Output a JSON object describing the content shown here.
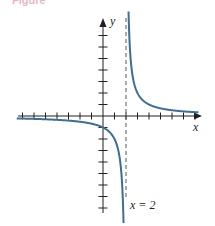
{
  "caption_fragment": "Figure",
  "chart_data": {
    "type": "line",
    "title": "",
    "function": "y = 2/(x - 2)",
    "xlabel": "x",
    "ylabel": "y",
    "xlim": [
      -7.5,
      8.5
    ],
    "ylim": [
      -9,
      8.5
    ],
    "x_ticks": [
      -7,
      -6,
      -5,
      -4,
      -3,
      -2,
      -1,
      1,
      2,
      3,
      4,
      5,
      6,
      7,
      8
    ],
    "y_ticks": [
      -8,
      -7,
      -6,
      -5,
      -4,
      -3,
      -2,
      -1,
      1,
      2,
      3,
      4,
      5,
      6,
      7
    ],
    "grid": false,
    "asymptote": {
      "type": "vertical",
      "x": 2,
      "label": "x = 2",
      "style": "dashed"
    },
    "series": [
      {
        "name": "left branch",
        "color": "#3b6e98",
        "points": [
          [
            -7.5,
            -0.21
          ],
          [
            -6,
            -0.25
          ],
          [
            -4,
            -0.33
          ],
          [
            -2,
            -0.5
          ],
          [
            0,
            -1
          ],
          [
            1,
            -2
          ],
          [
            1.5,
            -4
          ],
          [
            1.75,
            -8
          ],
          [
            1.78,
            -9
          ]
        ]
      },
      {
        "name": "right branch",
        "color": "#3b6e98",
        "points": [
          [
            2.22,
            9
          ],
          [
            2.25,
            8
          ],
          [
            2.5,
            4
          ],
          [
            3,
            2
          ],
          [
            4,
            1
          ],
          [
            5,
            0.67
          ],
          [
            6,
            0.5
          ],
          [
            7,
            0.4
          ],
          [
            8,
            0.33
          ]
        ]
      }
    ],
    "colors": {
      "axes": "#231f20",
      "curve": "#3b6e98",
      "asymptote": "#555555"
    }
  }
}
